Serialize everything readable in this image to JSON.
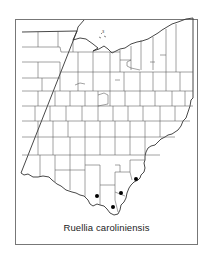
{
  "map": {
    "region": "Ohio",
    "subdivision": "counties",
    "caption": "Ruellia caroliniensis",
    "island_label": "3",
    "colors": {
      "outline": "#333333",
      "county_lines": "#555555",
      "frame": "#777777",
      "dot": "#000000"
    },
    "occurrence_points": [
      {
        "x": 97,
        "y": 196
      },
      {
        "x": 113,
        "y": 207
      },
      {
        "x": 121,
        "y": 193
      },
      {
        "x": 136,
        "y": 179
      }
    ]
  }
}
